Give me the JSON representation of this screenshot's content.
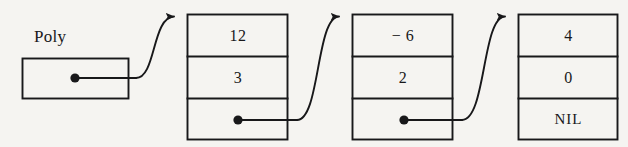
{
  "diagram": {
    "head_pointer": {
      "label": "Poly",
      "field_name": "head-pointer-box"
    },
    "ink_color": "#18181a",
    "background_color": "#f5f4f1",
    "nil_label": "NIL",
    "nodes": [
      {
        "index": 1,
        "coefficient": "12",
        "exponent": "3",
        "next": "pointer"
      },
      {
        "index": 2,
        "coefficient": "− 6",
        "exponent": "2",
        "next": "pointer"
      },
      {
        "index": 3,
        "coefficient": "4",
        "exponent": "0",
        "next": "NIL"
      }
    ]
  }
}
